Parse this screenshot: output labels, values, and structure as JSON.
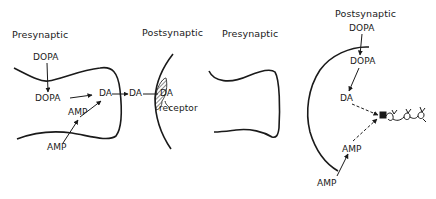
{
  "panels": [
    {
      "title": "Presynaptic",
      "labels": {
        "dopa_outside": "DOPA",
        "dopa_inside": "DOPA",
        "da_inside": "DA",
        "amp_inside": "AMP",
        "amp_outside": "AMP"
      }
    },
    {
      "title": "Postsynaptic",
      "labels": {
        "da_cleft": "DA",
        "da_bound": "DA",
        "receptor": "receptor"
      }
    },
    {
      "title": "Presynaptic",
      "labels": {}
    },
    {
      "title": "Postsynaptic",
      "labels": {
        "dopa_outside": "DOPA",
        "dopa_inside": "DOPA",
        "da_inside": "DA",
        "amp_inside": "AMP",
        "amp_outside": "AMP"
      }
    }
  ],
  "colors": {
    "ink": "#1a1a1a",
    "background": "#ffffff"
  }
}
